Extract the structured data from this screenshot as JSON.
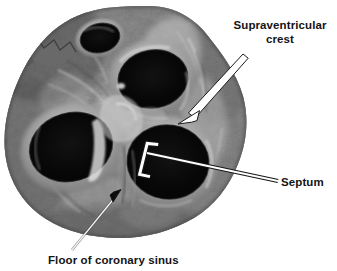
{
  "figure": {
    "type": "anatomical-photograph",
    "background_color": "#ffffff",
    "width": 337,
    "height": 271
  },
  "labels": {
    "supraventricular_crest": {
      "line1": "Supraventricular",
      "line2": "crest",
      "text_color": "#141414",
      "marker": "white-outlined-arrow",
      "points_to": "supraventricular crest ridge"
    },
    "septum": {
      "text": "Septum",
      "text_color": "#141414",
      "marker": "white-bracket-with-leader-line",
      "points_to": "interventricular septum"
    },
    "floor_of_coronary_sinus": {
      "text": "Floor of coronary sinus",
      "text_color": "#141414",
      "marker": "black-arrowhead-on-white-line",
      "points_to": "floor of the coronary sinus"
    }
  },
  "specimen": {
    "tone_light": "#c9c9c9",
    "tone_mid": "#8f8f8f",
    "tone_dark": "#4a4a4a",
    "orifice_color": "#0a0a0a",
    "orifices": [
      {
        "name": "upper-left-orifice"
      },
      {
        "name": "upper-central-orifice"
      },
      {
        "name": "lower-left-orifice"
      },
      {
        "name": "lower-right-orifice"
      }
    ]
  }
}
